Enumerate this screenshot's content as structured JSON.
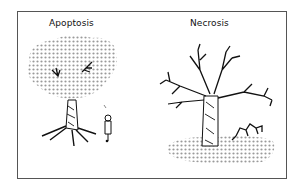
{
  "diagram": {
    "panels": [
      {
        "title": "Apoptosis",
        "description": "Leafy tree shedding dotted leaves cleanly; small person standing beside tree"
      },
      {
        "title": "Necrosis",
        "description": "Bare dead tree with leaves scattered in pile on ground; small animal/debris in pile"
      }
    ],
    "colors": {
      "frame": "#555555",
      "ink": "#111111",
      "dots": "#9a9a9a"
    }
  }
}
